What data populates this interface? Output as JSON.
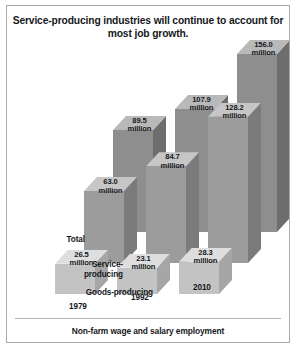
{
  "figure": {
    "title": "Service-producing industries will continue to\naccount for most job growth.",
    "footer": "Non-farm wage and salary employment"
  },
  "axis": {
    "series_labels": [
      "Total",
      "Service-\nproducing",
      "Goods-producing"
    ],
    "year_labels": [
      "1979",
      "1992",
      "2010"
    ]
  },
  "labels": {
    "total": [
      "89.5\nmillion",
      "107.9\nmillion",
      "156.0\nmillion"
    ],
    "service": [
      "63.0\nmillion",
      "84.7\nmillion",
      "128.2\nmillion"
    ],
    "goods": [
      "26.5\nmillion",
      "23.1\nmillion",
      "28.3\nmillion"
    ]
  },
  "colors": {
    "border": "#a9a9a9",
    "text": "#16181c",
    "total_top": "#b9b9b9",
    "total_left": "#8e8e8e",
    "total_right": "#6d6d6d",
    "service_top": "#c6c6c6",
    "service_left": "#9c9c9c",
    "service_right": "#7b7b7b",
    "goods_top": "#dedede",
    "goods_left": "#c3c3c3",
    "goods_right": "#a6a6a6"
  },
  "chart_data": {
    "type": "bar",
    "title": "Service-producing industries will continue to account for most job growth.",
    "subtitle": "Non-farm wage and salary employment",
    "categories": [
      "1979",
      "1992",
      "2010"
    ],
    "series": [
      {
        "name": "Total",
        "values": [
          89.5,
          107.9,
          156.0
        ]
      },
      {
        "name": "Service-producing",
        "values": [
          63.0,
          84.7,
          128.2
        ]
      },
      {
        "name": "Goods-producing",
        "values": [
          26.5,
          23.1,
          28.3
        ]
      }
    ],
    "units": "million",
    "value_label_suffix": "million",
    "xlabel": "",
    "ylabel": "",
    "ylim": [
      0,
      156
    ],
    "grid": false,
    "legend": "none",
    "projection": "3d-isometric"
  }
}
